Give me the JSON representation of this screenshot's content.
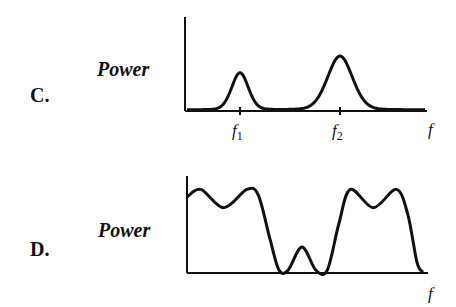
{
  "panels": [
    {
      "id": "C",
      "label": "C.",
      "ylabel": "Power",
      "xlabel": "f",
      "ticks": [
        {
          "base": "f",
          "sub": "1",
          "x": 1.0
        },
        {
          "base": "f",
          "sub": "2",
          "x": 2.0
        }
      ],
      "description": "Two separated resonance peaks; smaller peak at f1, taller broader peak at f2",
      "peaks": [
        {
          "center": 1.0,
          "height": 0.4,
          "width": 0.12
        },
        {
          "center": 2.0,
          "height": 0.58,
          "width": 0.18
        }
      ]
    },
    {
      "id": "D",
      "label": "D.",
      "ylabel": "Power",
      "xlabel": "f",
      "ticks": [],
      "description": "Two broad double-humped bands separated by a small central bump",
      "curve": [
        [
          0.0,
          0.78
        ],
        [
          0.12,
          0.86
        ],
        [
          0.32,
          0.67
        ],
        [
          0.52,
          0.86
        ],
        [
          0.62,
          0.8
        ],
        [
          0.72,
          0.35
        ],
        [
          0.8,
          0.02
        ],
        [
          0.88,
          0.02
        ],
        [
          1.0,
          0.26
        ],
        [
          1.12,
          0.02
        ],
        [
          1.22,
          0.02
        ],
        [
          1.32,
          0.5
        ],
        [
          1.42,
          0.86
        ],
        [
          1.62,
          0.67
        ],
        [
          1.82,
          0.86
        ],
        [
          1.92,
          0.6
        ],
        [
          2.0,
          0.1
        ],
        [
          2.05,
          0.0
        ]
      ]
    }
  ],
  "chart_data": [
    {
      "type": "line",
      "title": "C.",
      "xlabel": "f",
      "ylabel": "Power",
      "x_tick_labels": [
        "f1",
        "f2"
      ],
      "series": [
        {
          "name": "spectrum C",
          "peaks_at": [
            "f1",
            "f2"
          ],
          "relative_heights": [
            0.4,
            0.58
          ]
        }
      ]
    },
    {
      "type": "line",
      "title": "D.",
      "xlabel": "f",
      "ylabel": "Power",
      "x_tick_labels": [],
      "series": [
        {
          "name": "spectrum D",
          "shape": "two double-peaked bands with small central bump"
        }
      ]
    }
  ]
}
